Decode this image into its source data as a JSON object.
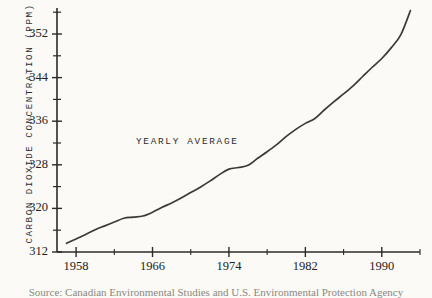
{
  "figure": {
    "background_color": "#fbfaf7",
    "ink_color": "#2b2b2b",
    "caption": "Source: Canadian Environmental Studies and U.S. Environmental Protection Agency"
  },
  "chart_data": {
    "type": "line",
    "title": "",
    "xlabel": "",
    "ylabel": "CARBON DIOXIDE CONCENTRATION (PPM)",
    "annotation": "YEARLY AVERAGE",
    "grid": false,
    "legend": "none",
    "xlim": [
      1956,
      1994
    ],
    "ylim": [
      312,
      358
    ],
    "xticks": [
      1958,
      1966,
      1974,
      1982,
      1990
    ],
    "xtick_labels": [
      "1958",
      "1966",
      "1974",
      "1982",
      "1990"
    ],
    "x_minor_tick_interval": 4,
    "yticks": [
      312,
      320,
      328,
      336,
      344,
      352
    ],
    "ytick_labels": [
      "312",
      "320",
      "328",
      "336",
      "344",
      "352"
    ],
    "y_minor_tick_interval": 4,
    "series": [
      {
        "name": "Yearly average CO2 concentration",
        "x": [
          1957,
          1958,
          1959,
          1960,
          1961,
          1962,
          1963,
          1964,
          1965,
          1966,
          1967,
          1968,
          1969,
          1970,
          1971,
          1972,
          1973,
          1974,
          1975,
          1976,
          1977,
          1978,
          1979,
          1980,
          1981,
          1982,
          1983,
          1984,
          1985,
          1986,
          1987,
          1988,
          1989,
          1990,
          1991,
          1992,
          1993
        ],
        "y": [
          313.6,
          314.4,
          315.2,
          316.1,
          316.8,
          317.5,
          318.2,
          318.4,
          318.6,
          319.3,
          320.2,
          321.0,
          321.9,
          322.9,
          323.9,
          325.0,
          326.2,
          327.2,
          327.5,
          327.9,
          329.2,
          330.4,
          331.7,
          333.2,
          334.5,
          335.6,
          336.5,
          338.1,
          339.6,
          341.0,
          342.5,
          344.2,
          345.9,
          347.5,
          349.5,
          351.9,
          356.3
        ]
      }
    ]
  },
  "axis_geometry": {
    "plot_left_px": 57,
    "plot_bottom_px": 252,
    "plot_top_px": 8,
    "plot_right_px": 420
  }
}
